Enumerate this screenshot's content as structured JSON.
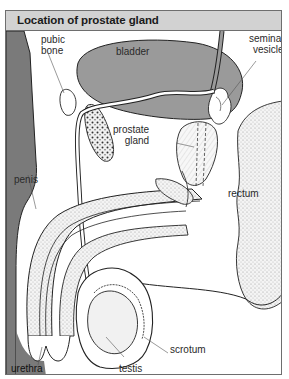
{
  "diagram": {
    "title": "Location of prostate gland",
    "labels": {
      "pubic_bone": [
        "pubic",
        "bone"
      ],
      "bladder": "bladder",
      "seminal_vesicle": [
        "seminal",
        "vesicle"
      ],
      "prostate_gland": [
        "prostate",
        "gland"
      ],
      "penis": "penis",
      "rectum": "rectum",
      "scrotum": "scrotum",
      "urethra": "urethra",
      "testis": "testis"
    },
    "colors": {
      "title_bar": "#d2d2d2",
      "body_dark": "#7a7a7a",
      "bladder": "#9a9a9a",
      "line": "#222222",
      "stipple": "#e6e6e6"
    }
  }
}
